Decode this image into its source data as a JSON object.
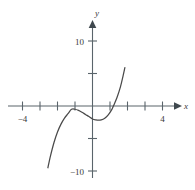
{
  "chart_data": {
    "type": "line",
    "title": "",
    "subtitle": "",
    "xlabel": "x",
    "ylabel": "y",
    "xlim": [
      -5.3,
      4.9
    ],
    "ylim": [
      -13.0,
      13.0
    ],
    "grid": false,
    "legend": null,
    "x_tick_labels": [
      {
        "value": -4,
        "text": "−4"
      },
      {
        "value": 4,
        "text": "4"
      }
    ],
    "y_tick_labels": [
      {
        "value": 10,
        "text": "10"
      },
      {
        "value": -10,
        "text": "−10"
      }
    ],
    "x_ticks_unlabeled": [
      -4,
      -3,
      -2,
      -1,
      1,
      2,
      3,
      4
    ],
    "y_ticks_unlabeled": [
      10,
      5,
      -5,
      -10
    ],
    "x_tick_step": 1,
    "y_tick_step": 5,
    "series": [
      {
        "name": "cubic",
        "comment": "y = x^3 + x^2 - x - 2 style cubic, drawn from about x=-2.55 to x=1.85",
        "x_start": -2.55,
        "x_end": 1.85,
        "points": [
          [
            -2.55,
            -9.5
          ],
          [
            -2.4,
            -7.67
          ],
          [
            -2.2,
            -5.61
          ],
          [
            -2.0,
            -4.0
          ],
          [
            -1.8,
            -2.79
          ],
          [
            -1.6,
            -1.86
          ],
          [
            -1.4,
            -1.18
          ],
          [
            -1.2,
            -0.51
          ],
          [
            -1.0,
            -0.5
          ],
          [
            -0.8,
            -0.67
          ],
          [
            -0.6,
            -0.96
          ],
          [
            -0.4,
            -1.3
          ],
          [
            -0.2,
            -1.63
          ],
          [
            0.0,
            -2.0
          ],
          [
            0.2,
            -2.15
          ],
          [
            0.33,
            -2.19
          ],
          [
            0.5,
            -2.13
          ],
          [
            0.7,
            -1.87
          ],
          [
            0.9,
            -1.36
          ],
          [
            1.1,
            -0.56
          ],
          [
            1.2,
            0.03
          ],
          [
            1.4,
            1.3
          ],
          [
            1.6,
            2.98
          ],
          [
            1.75,
            4.67
          ],
          [
            1.85,
            5.9
          ]
        ]
      }
    ],
    "colors": {
      "axis": "#555f66",
      "curve": "#4a4a4a",
      "text": "#3a3a3a",
      "background": "#ffffff"
    }
  },
  "axes": {
    "x_axis_name": "x-axis",
    "y_axis_name": "y-axis",
    "x_arrow": "arrow-right",
    "y_arrow": "arrow-up"
  }
}
